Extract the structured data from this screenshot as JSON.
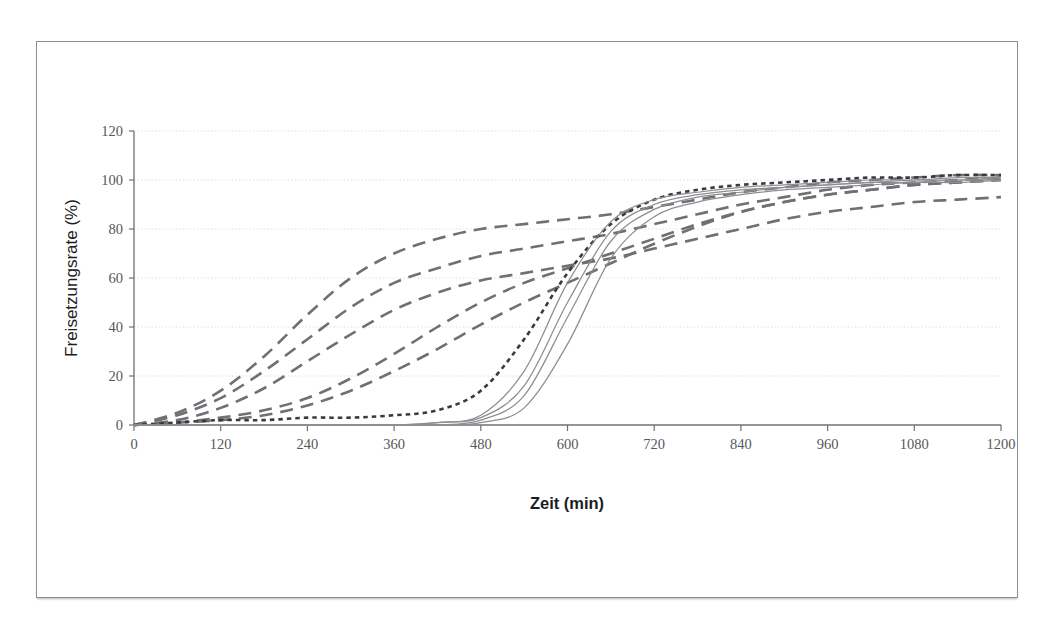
{
  "chart_data": {
    "type": "line",
    "title": "",
    "xlabel": "Zeit (min)",
    "ylabel": "Freisetzungsrate (%)",
    "xlim": [
      0,
      1200
    ],
    "ylim": [
      0,
      120
    ],
    "xticks": [
      0,
      120,
      240,
      360,
      480,
      600,
      720,
      840,
      960,
      1080,
      1200
    ],
    "yticks": [
      0,
      20,
      40,
      60,
      80,
      100,
      120
    ],
    "grid": true,
    "legend": "none",
    "x": [
      0,
      60,
      120,
      180,
      240,
      300,
      360,
      420,
      480,
      540,
      600,
      660,
      720,
      780,
      840,
      900,
      960,
      1020,
      1080,
      1140,
      1200
    ],
    "series": [
      {
        "name": "dashed-fastest",
        "style": "long-dash",
        "color": "#6e7074",
        "values": [
          0,
          5,
          14,
          28,
          45,
          60,
          70,
          76,
          80,
          82,
          84,
          86,
          89,
          92,
          95,
          97,
          99,
          100,
          101,
          102,
          102
        ]
      },
      {
        "name": "dashed-fast",
        "style": "long-dash",
        "color": "#6e7074",
        "values": [
          0,
          4,
          11,
          22,
          35,
          48,
          58,
          64,
          69,
          72,
          75,
          78,
          82,
          86,
          90,
          93,
          96,
          98,
          99,
          100,
          101
        ]
      },
      {
        "name": "dashed-medium",
        "style": "long-dash",
        "color": "#6e7074",
        "values": [
          0,
          2,
          7,
          15,
          26,
          37,
          47,
          54,
          59,
          62,
          65,
          68,
          72,
          76,
          80,
          84,
          87,
          89,
          91,
          92,
          93
        ]
      },
      {
        "name": "dashed-delayed",
        "style": "long-dash",
        "color": "#6e7074",
        "values": [
          0,
          1,
          3,
          6,
          11,
          19,
          29,
          40,
          50,
          58,
          64,
          70,
          76,
          82,
          87,
          91,
          94,
          96,
          98,
          99,
          100
        ]
      },
      {
        "name": "dashed-slow",
        "style": "long-dash",
        "color": "#6e7074",
        "values": [
          0,
          1,
          2,
          4,
          8,
          14,
          22,
          31,
          41,
          50,
          58,
          66,
          74,
          81,
          87,
          91,
          94,
          96,
          98,
          99,
          100
        ]
      },
      {
        "name": "dotted-lag",
        "style": "fine-dot",
        "color": "#3a3b3e",
        "values": [
          0,
          1,
          2,
          2,
          3,
          3,
          4,
          6,
          14,
          35,
          62,
          82,
          92,
          96,
          98,
          99,
          100,
          101,
          101,
          102,
          102
        ]
      },
      {
        "name": "solid-sigmoid-1",
        "style": "solid",
        "color": "#8c8e92",
        "values": [
          0,
          0,
          0,
          0,
          0,
          0,
          0,
          1,
          4,
          22,
          58,
          83,
          92,
          95,
          97,
          98,
          99,
          100,
          100,
          101,
          101
        ]
      },
      {
        "name": "solid-sigmoid-2",
        "style": "solid",
        "color": "#8c8e92",
        "values": [
          0,
          0,
          0,
          0,
          0,
          0,
          0,
          1,
          3,
          16,
          50,
          79,
          90,
          94,
          96,
          97,
          98,
          99,
          100,
          100,
          101
        ]
      },
      {
        "name": "solid-sigmoid-3",
        "style": "solid",
        "color": "#8c8e92",
        "values": [
          0,
          0,
          0,
          0,
          0,
          0,
          0,
          0,
          2,
          12,
          44,
          75,
          88,
          93,
          95,
          97,
          98,
          99,
          99,
          100,
          100
        ]
      },
      {
        "name": "solid-sigmoid-4",
        "style": "solid",
        "color": "#8c8e92",
        "values": [
          0,
          0,
          0,
          0,
          0,
          0,
          0,
          0,
          1,
          7,
          33,
          68,
          85,
          91,
          94,
          96,
          97,
          98,
          99,
          99,
          100
        ]
      }
    ]
  },
  "axes": {
    "x_title": "Zeit (min)",
    "y_title": "Freisetzungsrate (%)",
    "x_tick_labels": [
      "0",
      "120",
      "240",
      "360",
      "480",
      "600",
      "720",
      "840",
      "960",
      "1080",
      "1200"
    ],
    "y_tick_labels": [
      "0",
      "20",
      "40",
      "60",
      "80",
      "100",
      "120"
    ]
  }
}
